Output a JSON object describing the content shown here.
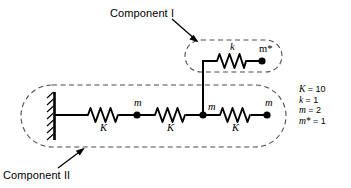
{
  "figure": {
    "type": "mechanical-schematic",
    "title_labels": {
      "component_1": "Component I",
      "component_2": "Component II"
    },
    "masses": [
      {
        "id": "m1",
        "label": "m",
        "x": 137,
        "y": 115
      },
      {
        "id": "m2",
        "label": "m",
        "x": 203,
        "y": 115
      },
      {
        "id": "m3",
        "label": "m",
        "x": 267,
        "y": 115
      },
      {
        "id": "mstar",
        "label": "m*",
        "x": 262,
        "y": 57
      }
    ],
    "springs": [
      {
        "id": "s1",
        "label": "K",
        "x": 103,
        "y": 115
      },
      {
        "id": "s2",
        "label": "K",
        "x": 170,
        "y": 115
      },
      {
        "id": "s3",
        "label": "K",
        "x": 235,
        "y": 115
      },
      {
        "id": "s4",
        "label": "k",
        "x": 232,
        "y": 57
      }
    ],
    "legend": {
      "rows": [
        {
          "name": "K",
          "eq": "= 10"
        },
        {
          "name": "k",
          "eq": "= 1"
        },
        {
          "name": "m",
          "eq": "= 2"
        },
        {
          "name": "m*",
          "eq": "= 1"
        }
      ]
    },
    "colors": {
      "ink": "#000000",
      "background": "#ffffff",
      "dashed_outline": "#555555"
    }
  }
}
